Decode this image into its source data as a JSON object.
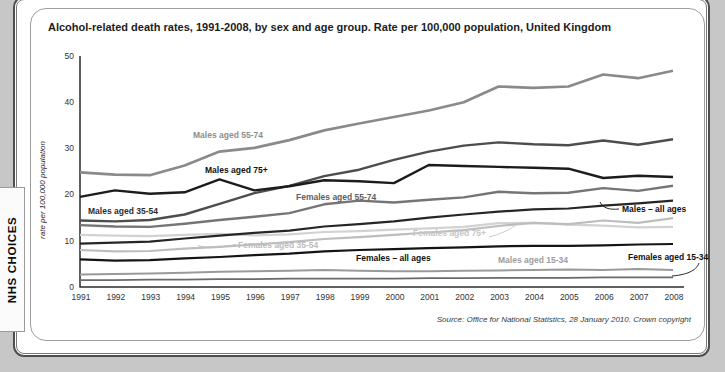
{
  "brand": {
    "tab_label": "NHS CHOICES"
  },
  "chart": {
    "title": "Alcohol-related death rates, 1991-2008, by sex and age group. Rate per 100,000 population, United Kingdom",
    "source_note": "Source: Office for National Statistics, 28 January 2010. Crown copyright"
  },
  "chart_data": {
    "type": "line",
    "title": "Alcohol-related death rates, 1991-2008, by sex and age group. Rate per 100,000 population, United Kingdom",
    "xlabel": "",
    "ylabel": "rate per 100,000 population",
    "ylim": [
      0,
      50
    ],
    "yticks": [
      0,
      10,
      20,
      30,
      40,
      50
    ],
    "grid": false,
    "legend_position": "inline-labels",
    "x": [
      1991,
      1992,
      1993,
      1994,
      1995,
      1996,
      1997,
      1998,
      1999,
      2000,
      2001,
      2002,
      2003,
      2004,
      2005,
      2006,
      2007,
      2008
    ],
    "series": [
      {
        "id": "females-75plus",
        "name": "Females aged 75+",
        "color": "#d2d2d2",
        "width": 2.2,
        "values": [
          11.3,
          11.1,
          11.0,
          11.3,
          11.5,
          11.2,
          11.4,
          11.9,
          12.1,
          12.4,
          12.7,
          13.0,
          13.8,
          13.9,
          13.5,
          13.3,
          12.9,
          13.0
        ],
        "label": {
          "text": "Females aged 75+",
          "x": 413,
          "y": 236,
          "color": "#c6c6c6",
          "connector": "M 489,237 Q 505,233 516,225"
        }
      },
      {
        "id": "females-35-54",
        "name": "Females aged 35-54",
        "color": "#bdbdbd",
        "width": 2.2,
        "values": [
          8.0,
          7.7,
          7.8,
          8.3,
          8.7,
          9.2,
          9.7,
          10.4,
          10.8,
          11.3,
          11.8,
          12.3,
          13.2,
          13.9,
          13.6,
          14.4,
          13.9,
          14.9
        ],
        "label": {
          "text": "Females aged 35-54",
          "x": 238,
          "y": 248,
          "color": "#bcbcbc",
          "connector": "M 236,244.5 C 218,248 205,248 198,245.5"
        }
      },
      {
        "id": "males-15-34",
        "name": "Males aged 15-34",
        "color": "#9a9a9a",
        "width": 2,
        "values": [
          2.7,
          2.8,
          2.9,
          3.1,
          3.3,
          3.4,
          3.5,
          3.7,
          3.5,
          3.4,
          3.4,
          3.5,
          3.6,
          3.7,
          3.8,
          3.7,
          3.9,
          3.7
        ],
        "label": {
          "text": "Males aged 15-34",
          "x": 498,
          "y": 263,
          "color": "#9d9d9d"
        }
      },
      {
        "id": "females-15-34",
        "name": "Females aged 15-34",
        "color": "#6a6a6a",
        "width": 1.8,
        "values": [
          1.5,
          1.5,
          1.6,
          1.6,
          1.7,
          1.7,
          1.8,
          1.8,
          1.8,
          1.8,
          1.9,
          1.9,
          2.0,
          2.0,
          2.0,
          2.1,
          2.1,
          2.1
        ],
        "label": {
          "text": "Females aged 15-34",
          "x": 628,
          "y": 260,
          "color": "#111111",
          "connector": "M 672,276 C 690,274.5 697,269 699,263"
        }
      },
      {
        "id": "males-55-74",
        "name": "Males aged 55-74",
        "color": "#8a8a8a",
        "width": 2.7,
        "values": [
          24.8,
          24.3,
          24.2,
          26.3,
          29.3,
          30.1,
          31.8,
          33.9,
          35.4,
          36.8,
          38.2,
          40.0,
          43.4,
          43.1,
          43.4,
          46.0,
          45.2,
          46.8
        ],
        "label": {
          "text": "Males aged 55-74",
          "x": 193,
          "y": 138,
          "color": "#8e8e8e"
        }
      },
      {
        "id": "females-55-74",
        "name": "Females aged 55-74",
        "color": "#757575",
        "width": 2.4,
        "values": [
          13.4,
          13.1,
          13.0,
          13.7,
          14.5,
          15.2,
          16.0,
          17.9,
          18.7,
          18.3,
          18.9,
          19.4,
          20.6,
          20.3,
          20.4,
          21.4,
          20.8,
          21.9
        ],
        "label": {
          "text": "Females aged 55-74",
          "x": 296,
          "y": 200,
          "color": "#5f5f5f"
        }
      },
      {
        "id": "males-35-54",
        "name": "Males aged 35-54",
        "color": "#4d4d4d",
        "width": 2.4,
        "values": [
          14.4,
          14.2,
          14.5,
          15.7,
          18.0,
          20.3,
          21.9,
          24.0,
          25.4,
          27.5,
          29.3,
          30.6,
          31.3,
          30.9,
          30.7,
          31.7,
          30.8,
          32.0
        ],
        "label": {
          "text": "Males aged 35-54",
          "x": 88,
          "y": 214,
          "color": "#2e2e2e"
        }
      },
      {
        "id": "males-all-ages",
        "name": "Males – all ages",
        "color": "#262626",
        "width": 2.2,
        "values": [
          9.4,
          9.6,
          9.8,
          10.5,
          11.1,
          11.7,
          12.2,
          13.1,
          13.6,
          14.2,
          15.0,
          15.7,
          16.3,
          16.8,
          17.0,
          17.6,
          18.1,
          18.7
        ],
        "label": {
          "text": "Males – all ages",
          "x": 622,
          "y": 212,
          "color": "#111111",
          "connector": "M 600,202 C 603,208 609,210 619,209"
        }
      },
      {
        "id": "females-all-ages",
        "name": "Females – all ages",
        "color": "#141414",
        "width": 2.2,
        "values": [
          6.0,
          5.7,
          5.8,
          6.2,
          6.5,
          6.9,
          7.2,
          7.7,
          8.0,
          8.2,
          8.4,
          8.6,
          8.8,
          8.9,
          8.9,
          9.0,
          9.2,
          9.3
        ],
        "label": {
          "text": "Females – all ages",
          "x": 356,
          "y": 261,
          "color": "#111111"
        }
      },
      {
        "id": "males-75plus",
        "name": "Males aged 75+",
        "color": "#1c1c1c",
        "width": 2.4,
        "values": [
          19.5,
          20.9,
          20.2,
          20.5,
          23.3,
          20.9,
          21.8,
          23.1,
          22.9,
          22.5,
          26.4,
          26.2,
          26.0,
          25.8,
          25.6,
          23.6,
          24.1,
          23.8
        ],
        "label": {
          "text": "Males aged 75+",
          "x": 205,
          "y": 173,
          "color": "#111111"
        }
      }
    ]
  }
}
